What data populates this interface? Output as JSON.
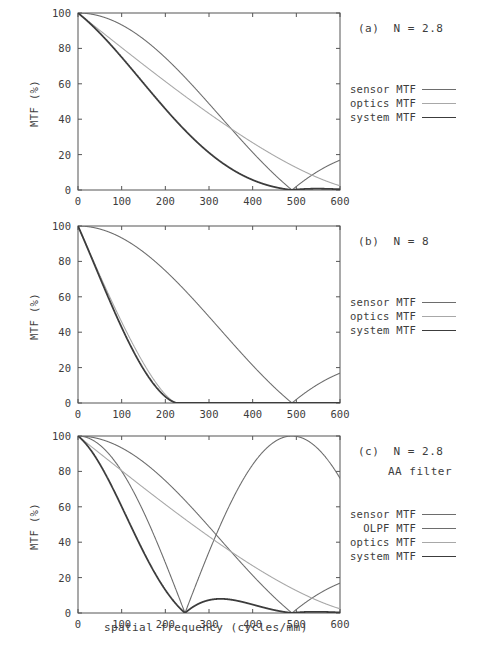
{
  "figure": {
    "xlabel": "spatial frequency (cycles/mm)",
    "ylabel": "MTF (%)",
    "xticks": [
      "0",
      "100",
      "200",
      "300",
      "400",
      "500",
      "600"
    ],
    "yticks": [
      "0",
      "20",
      "40",
      "60",
      "80",
      "100"
    ]
  },
  "colors": {
    "sensor": "#6d6d6d",
    "olpf": "#6d6d6d",
    "optics": "#a8a8a8",
    "system": "#3c3c3c",
    "axis": "#555555",
    "text": "#3d3d3d"
  },
  "panels": [
    {
      "id": "a",
      "label_line1": "(a)  N = 2.8",
      "label_line2": "",
      "legend": [
        {
          "label": "sensor MTF",
          "color_key": "sensor",
          "width": 1.1
        },
        {
          "label": "optics MTF",
          "color_key": "optics",
          "width": 1.1
        },
        {
          "label": "system MTF",
          "color_key": "system",
          "width": 1.7
        }
      ]
    },
    {
      "id": "b",
      "label_line1": "(b)  N = 8",
      "label_line2": "",
      "legend": [
        {
          "label": "sensor MTF",
          "color_key": "sensor",
          "width": 1.1
        },
        {
          "label": "optics MTF",
          "color_key": "optics",
          "width": 1.1
        },
        {
          "label": "system MTF",
          "color_key": "system",
          "width": 1.7
        }
      ]
    },
    {
      "id": "c",
      "label_line1": "(c)  N = 2.8",
      "label_line2": "AA filter",
      "legend": [
        {
          "label": "sensor MTF",
          "color_key": "sensor",
          "width": 1.1
        },
        {
          "label": "OLPF MTF",
          "color_key": "olpf",
          "width": 1.1
        },
        {
          "label": "optics MTF",
          "color_key": "optics",
          "width": 1.1
        },
        {
          "label": "system MTF",
          "color_key": "system",
          "width": 1.7
        }
      ]
    }
  ],
  "chart_data": {
    "type": "line",
    "title": "",
    "xlabel": "spatial frequency (cycles/mm)",
    "ylabel": "MTF (%)",
    "xlim": [
      0,
      600
    ],
    "ylim": [
      0,
      100
    ],
    "xticks": [
      0,
      100,
      200,
      300,
      400,
      500,
      600
    ],
    "yticks": [
      0,
      20,
      40,
      60,
      80,
      100
    ],
    "grid": false,
    "legend_position": "right-outside",
    "panels": [
      {
        "id": "a",
        "annotation": "(a)  N = 2.8",
        "aperture_N": 2.8,
        "aa_filter": false,
        "series": [
          {
            "name": "sensor MTF",
            "model": "abs_sinc",
            "nyquist_zero": 490,
            "x": [
              0,
              50,
              100,
              150,
              200,
              250,
              300,
              350,
              400,
              450,
              490,
              500,
              550,
              600
            ],
            "values": [
              100,
              98.6,
              94.6,
              88.2,
              79.7,
              69.6,
              58.2,
              46.0,
              33.3,
              20.2,
              0,
              2.0,
              8.9,
              15.0
            ]
          },
          {
            "name": "optics MTF",
            "model": "diffraction_mtf",
            "cutoff": 648,
            "x": [
              0,
              50,
              100,
              150,
              200,
              250,
              300,
              350,
              400,
              450,
              500,
              550,
              600
            ],
            "values": [
              100,
              90.2,
              80.5,
              71.0,
              61.6,
              52.5,
              43.6,
              35.1,
              27.0,
              19.5,
              12.7,
              7.0,
              2.7
            ]
          },
          {
            "name": "system MTF",
            "model": "sensor_x_optics",
            "x": [
              0,
              50,
              100,
              150,
              200,
              250,
              300,
              350,
              400,
              450,
              490,
              500,
              550,
              600
            ],
            "values": [
              100,
              88.9,
              76.1,
              62.6,
              49.1,
              36.5,
              25.4,
              16.1,
              9.0,
              3.9,
              0,
              0.3,
              0.6,
              0.4
            ]
          }
        ]
      },
      {
        "id": "b",
        "annotation": "(b)  N = 8",
        "aperture_N": 8,
        "aa_filter": false,
        "series": [
          {
            "name": "sensor MTF",
            "model": "abs_sinc",
            "nyquist_zero": 490,
            "x": [
              0,
              50,
              100,
              150,
              200,
              250,
              300,
              350,
              400,
              450,
              490,
              500,
              550,
              600
            ],
            "values": [
              100,
              98.6,
              94.6,
              88.2,
              79.7,
              69.6,
              58.2,
              46.0,
              33.3,
              20.2,
              0,
              2.0,
              8.9,
              15.0
            ]
          },
          {
            "name": "optics MTF",
            "model": "diffraction_mtf",
            "cutoff": 227,
            "x": [
              0,
              25,
              50,
              75,
              100,
              125,
              150,
              175,
              200,
              215,
              227
            ],
            "values": [
              100,
              86.0,
              72.2,
              58.8,
              45.9,
              33.9,
              22.9,
              13.2,
              5.4,
              1.7,
              0
            ]
          },
          {
            "name": "system MTF",
            "model": "sensor_x_optics",
            "x": [
              0,
              25,
              50,
              75,
              100,
              125,
              150,
              175,
              200,
              215,
              227
            ],
            "values": [
              100,
              85.5,
              71.2,
              57.3,
              43.4,
              31.1,
              20.2,
              11.1,
              4.3,
              1.3,
              0
            ]
          }
        ]
      },
      {
        "id": "c",
        "annotation": "(c)  N = 2.8 / AA filter",
        "aperture_N": 2.8,
        "aa_filter": true,
        "series": [
          {
            "name": "sensor MTF",
            "model": "abs_sinc",
            "nyquist_zero": 490,
            "x": [
              0,
              50,
              100,
              150,
              200,
              250,
              300,
              350,
              400,
              450,
              490,
              500,
              550,
              600
            ],
            "values": [
              100,
              98.6,
              94.6,
              88.2,
              79.7,
              69.6,
              58.2,
              46.0,
              33.3,
              20.2,
              0,
              2.0,
              8.9,
              15.0
            ]
          },
          {
            "name": "OLPF MTF",
            "model": "abs_cos",
            "zero": 245,
            "peak": 490,
            "x": [
              0,
              50,
              100,
              150,
              200,
              245,
              300,
              350,
              400,
              450,
              490,
              550,
              600
            ],
            "values": [
              100,
              94.9,
              79.9,
              56.4,
              27.0,
              0,
              33.0,
              59.0,
              80.0,
              95.0,
              100,
              89.0,
              81.0
            ]
          },
          {
            "name": "optics MTF",
            "model": "diffraction_mtf",
            "cutoff": 648,
            "x": [
              0,
              50,
              100,
              150,
              200,
              250,
              300,
              350,
              400,
              450,
              500,
              550,
              600
            ],
            "values": [
              100,
              90.2,
              80.5,
              71.0,
              61.6,
              52.5,
              43.6,
              35.1,
              27.0,
              19.5,
              12.7,
              7.0,
              2.7
            ]
          },
          {
            "name": "system MTF",
            "model": "sensor_x_optics_x_olpf",
            "x": [
              0,
              50,
              100,
              150,
              200,
              245,
              280,
              320,
              350,
              400,
              450,
              490,
              550,
              600
            ],
            "values": [
              100,
              84.3,
              60.8,
              35.3,
              13.3,
              0,
              5.5,
              8.0,
              7.6,
              4.6,
              1.9,
              0,
              0.4,
              0.3
            ]
          }
        ]
      }
    ]
  }
}
